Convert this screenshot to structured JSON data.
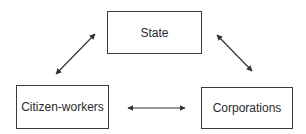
{
  "diagram": {
    "nodes": [
      {
        "id": "state",
        "label": "State",
        "x": 107,
        "y": 11,
        "w": 95,
        "h": 43
      },
      {
        "id": "citizen-workers",
        "label": "Citizen-workers",
        "x": 16,
        "y": 85,
        "w": 93,
        "h": 44
      },
      {
        "id": "corporations",
        "label": "Corporations",
        "x": 201,
        "y": 87,
        "w": 92,
        "h": 42
      }
    ],
    "edges": [
      {
        "from": "citizen-workers",
        "to": "state",
        "type": "bidirectional"
      },
      {
        "from": "state",
        "to": "corporations",
        "type": "bidirectional"
      },
      {
        "from": "citizen-workers",
        "to": "corporations",
        "type": "bidirectional"
      }
    ],
    "colors": {
      "line": "#333333",
      "border": "#3a3a3a",
      "text": "#2a2a2a"
    }
  }
}
